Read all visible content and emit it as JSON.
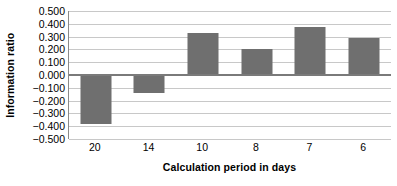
{
  "chart_data": {
    "type": "bar",
    "title": "",
    "subtitle": "",
    "xlabel": "Calculation period in days",
    "ylabel": "Information ratio",
    "categories": [
      "20",
      "14",
      "10",
      "8",
      "7",
      "6"
    ],
    "values": [
      -0.38,
      -0.14,
      0.33,
      0.205,
      0.375,
      0.29
    ],
    "series": [
      {
        "name": "Information ratio",
        "values": [
          -0.38,
          -0.14,
          0.33,
          0.205,
          0.375,
          0.29
        ]
      }
    ],
    "ylim": [
      -0.5,
      0.5
    ],
    "ytick_step": 0.1,
    "ytick_labels": [
      "0.500",
      "0.400",
      "0.300",
      "0.200",
      "0.100",
      "0.000",
      "−0.100",
      "−0.200",
      "−0.300",
      "−0.400",
      "−0.500"
    ],
    "ytick_values": [
      0.5,
      0.4,
      0.3,
      0.2,
      0.1,
      0.0,
      -0.1,
      -0.2,
      -0.3,
      -0.4,
      -0.5
    ],
    "grid": true,
    "grid_axis": "y",
    "legend": false,
    "legend_position": "none",
    "bar_color": "#6f6f6f",
    "grid_color": "#c8c8c8",
    "axis_color": "#8a8a8a",
    "zero_line_color": "#7a7a7a",
    "background_color": "#ffffff",
    "annotations": []
  }
}
